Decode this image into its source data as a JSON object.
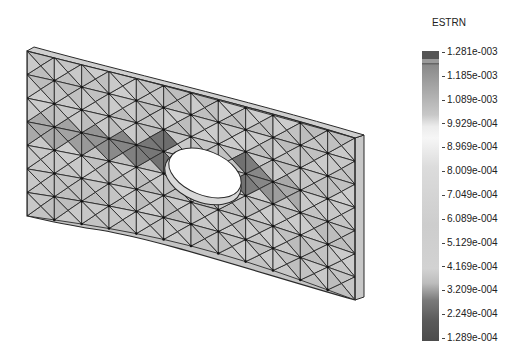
{
  "plot": {
    "quantity": "ESTRN",
    "description": "Equivalent strain contour on a meshed rectangular plate with central elliptical hole",
    "colormap": "grayscale",
    "colors": {
      "max": "#5a5a5a",
      "upper_mid": "#e8e8e8",
      "peak_light": "#ffffff",
      "mid": "#c8c8c8",
      "low": "#4e4e4e",
      "mesh_line": "#2a2a2a",
      "plate_base": "#c4c4c4"
    }
  },
  "legend": {
    "title": "ESTRN",
    "labels": [
      "1.281e-003",
      "1.185e-003",
      "1.089e-003",
      "9.929e-004",
      "8.969e-004",
      "8.009e-004",
      "7.049e-004",
      "6.089e-004",
      "5.129e-004",
      "4.169e-004",
      "3.209e-004",
      "2.249e-004",
      "1.289e-004"
    ],
    "max": "1.281e-003",
    "min": "1.289e-004"
  }
}
